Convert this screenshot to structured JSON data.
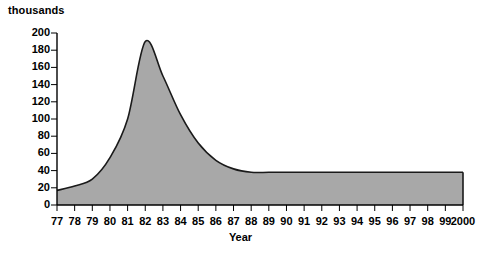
{
  "chart_data": {
    "type": "area",
    "title": "",
    "subtitle": "",
    "xlabel": "Year",
    "ylabel": "thousands",
    "unit_label": "thousands",
    "grid": false,
    "legend": "none",
    "fill_color": "#a8a8a8",
    "line_color": "#1a1a1a",
    "axis_color": "#000000",
    "background": "#ffffff",
    "ylim": [
      0,
      200
    ],
    "ytick_step": 20,
    "yticks": [
      "0",
      "20",
      "40",
      "60",
      "80",
      "100",
      "120",
      "140",
      "160",
      "180",
      "200"
    ],
    "categories": [
      "77",
      "78",
      "79",
      "80",
      "81",
      "82",
      "83",
      "84",
      "85",
      "86",
      "87",
      "88",
      "89",
      "90",
      "91",
      "92",
      "93",
      "94",
      "95",
      "96",
      "97",
      "98",
      "99",
      "2000"
    ],
    "values": [
      17,
      22,
      30,
      55,
      100,
      190,
      150,
      105,
      72,
      52,
      42,
      38,
      38,
      38,
      38,
      38,
      38,
      38,
      38,
      38,
      38,
      38,
      38,
      38
    ],
    "series": [
      {
        "name": "value",
        "values": [
          17,
          22,
          30,
          55,
          100,
          190,
          150,
          105,
          72,
          52,
          42,
          38,
          38,
          38,
          38,
          38,
          38,
          38,
          38,
          38,
          38,
          38,
          38,
          38
        ]
      }
    ],
    "annotations": {
      "peak_category": "82",
      "peak_value": 190,
      "plateau_value": 38,
      "plateau_from_category": "88"
    }
  }
}
